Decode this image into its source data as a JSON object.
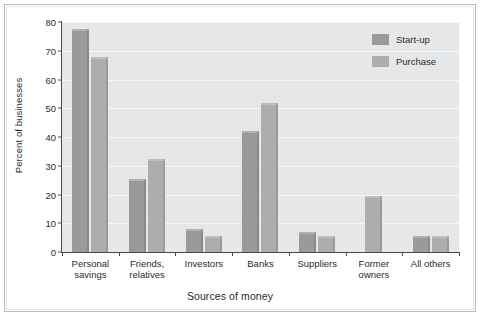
{
  "chart_data": {
    "type": "bar",
    "title": "",
    "xlabel": "Sources of money",
    "ylabel": "Percent of businesses",
    "ylim": [
      0,
      80
    ],
    "yticks": [
      0,
      10,
      20,
      30,
      40,
      50,
      60,
      70,
      80
    ],
    "grid": true,
    "legend_position": "top-right",
    "categories": [
      "Personal\nsavings",
      "Friends,\nrelatives",
      "Investors",
      "Banks",
      "Suppliers",
      "Former\nowners",
      "All others"
    ],
    "category_lines": [
      [
        "Personal",
        "savings"
      ],
      [
        "Friends,",
        "relatives"
      ],
      [
        "Investors",
        ""
      ],
      [
        "Banks",
        ""
      ],
      [
        "Suppliers",
        ""
      ],
      [
        "Former",
        "owners"
      ],
      [
        "All others",
        ""
      ]
    ],
    "series": [
      {
        "name": "Start-up",
        "color": "#9a9a9a",
        "values": [
          77.5,
          25.5,
          8,
          42,
          7,
          null,
          5.5
        ]
      },
      {
        "name": "Purchase",
        "color": "#adadad",
        "values": [
          68,
          32.5,
          5.5,
          52,
          5.5,
          19.5,
          5.5
        ]
      }
    ]
  },
  "legend": {
    "items": [
      {
        "label": "Start-up",
        "color": "#9a9a9a"
      },
      {
        "label": "Purchase",
        "color": "#adadad"
      }
    ]
  },
  "axes": {
    "ylabel": "Percent of businesses",
    "xlabel": "Sources of money"
  }
}
